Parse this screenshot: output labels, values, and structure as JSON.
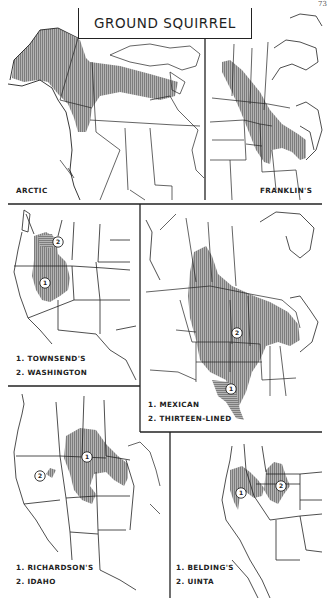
{
  "page": {
    "number": "73",
    "title": "GROUND SQUIRREL"
  },
  "maps": [
    {
      "id": "arctic",
      "legend": [
        "ARCTIC"
      ],
      "ranges": [
        {
          "marker": null,
          "species": "Arctic",
          "hatch": "vertical"
        }
      ]
    },
    {
      "id": "franklins",
      "legend": [
        "FRANKLIN'S"
      ],
      "ranges": [
        {
          "marker": null,
          "species": "Franklin's",
          "hatch": "vertical"
        }
      ]
    },
    {
      "id": "townsends-washington",
      "legend": [
        "1. TOWNSEND'S",
        "2. WASHINGTON"
      ],
      "ranges": [
        {
          "marker": "1",
          "species": "Townsend's",
          "hatch": "vertical"
        },
        {
          "marker": "2",
          "species": "Washington",
          "hatch": "horizontal"
        }
      ]
    },
    {
      "id": "mexican-thirteen-lined",
      "legend": [
        "1. MEXICAN",
        "2. THIRTEEN-LINED"
      ],
      "ranges": [
        {
          "marker": "1",
          "species": "Mexican",
          "hatch": "horizontal"
        },
        {
          "marker": "2",
          "species": "Thirteen-lined",
          "hatch": "vertical"
        }
      ]
    },
    {
      "id": "richardsons-idaho",
      "legend": [
        "1. RICHARDSON'S",
        "2. IDAHO"
      ],
      "ranges": [
        {
          "marker": "1",
          "species": "Richardson's",
          "hatch": "vertical"
        },
        {
          "marker": "2",
          "species": "Idaho",
          "hatch": "vertical"
        }
      ]
    },
    {
      "id": "beldings-uinta",
      "legend": [
        "1. BELDING'S",
        "2. UINTA"
      ],
      "ranges": [
        {
          "marker": "1",
          "species": "Belding's",
          "hatch": "vertical"
        },
        {
          "marker": "2",
          "species": "Uinta",
          "hatch": "vertical"
        }
      ]
    }
  ],
  "colors": {
    "ink": "#222222",
    "range_fill": "#9c9c9c",
    "paper": "#ffffff"
  }
}
